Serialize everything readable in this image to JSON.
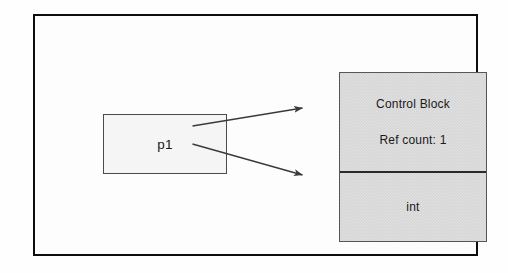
{
  "diagram": {
    "background_color": "#fefefe",
    "frame": {
      "border_color": "#0d0d0d"
    },
    "pointer_box": {
      "label": "p1",
      "fill_color": "#f5f5f5",
      "border_color": "#4a4a4a"
    },
    "control_block": {
      "fill_color": "#d6d6d6",
      "border_color": "#56565a",
      "divider_color": "#2b2b2b",
      "upper_section": {
        "heading": "Control Block",
        "ref_count_label": "Ref count: 1"
      },
      "lower_section": {
        "type_label": "int"
      }
    },
    "arrows": [
      {
        "name": "pointer-to-control-block",
        "from": "p1",
        "to": "Control Block",
        "color": "#3a3a3a"
      },
      {
        "name": "pointer-to-managed-object",
        "from": "p1",
        "to": "int",
        "color": "#3a3a3a"
      }
    ]
  }
}
